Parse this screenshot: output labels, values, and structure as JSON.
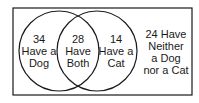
{
  "diagram": {
    "type": "venn",
    "colors": {
      "stroke": "#1a1a1a",
      "background": "#ffffff"
    },
    "regions": {
      "dog_only": {
        "count": "34",
        "line1": "Have a",
        "line2": "Dog"
      },
      "both": {
        "count": "28",
        "line1": "Have",
        "line2": "Both"
      },
      "cat_only": {
        "count": "14",
        "line1": "Have a",
        "line2": "Cat"
      },
      "neither": {
        "line1": "24 Have",
        "line2": "Neither",
        "line3": "a Dog",
        "line4": "nor a Cat"
      }
    }
  }
}
